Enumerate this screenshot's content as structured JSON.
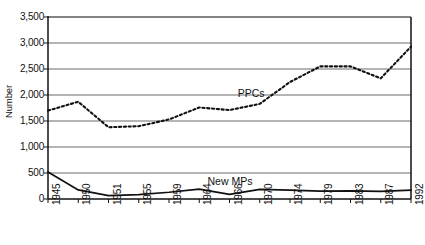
{
  "chart_data": {
    "type": "line",
    "title": "",
    "xlabel": "",
    "ylabel": "Number",
    "ylim": [
      0,
      3500
    ],
    "ytick_values": [
      0,
      500,
      1000,
      1500,
      2000,
      2500,
      3000,
      3500
    ],
    "ytick_labels": [
      "0",
      "500",
      "1,000",
      "1,500",
      "2,000",
      "2,500",
      "3,000",
      "3,500"
    ],
    "categories": [
      "1945",
      "1950",
      "1951",
      "1955",
      "1959",
      "1964",
      "1966",
      "1970",
      "1974",
      "1979",
      "1983",
      "1987",
      "1992"
    ],
    "grid": true,
    "legend_position": "inline-annotation",
    "series": [
      {
        "name": "PPCs",
        "style": "dashed",
        "color": "#111111",
        "values": [
          1700,
          1870,
          1380,
          1400,
          1530,
          1760,
          1710,
          1830,
          2250,
          2550,
          2550,
          2320,
          2930
        ]
      },
      {
        "name": "New MPs",
        "style": "solid",
        "color": "#111111",
        "values": [
          520,
          175,
          65,
          85,
          130,
          190,
          90,
          185,
          170,
          150,
          155,
          145,
          170
        ]
      }
    ],
    "annotations": [
      {
        "text": "PPCs",
        "x_year": "1970",
        "y_value": 2010
      },
      {
        "text": "New MPs",
        "x_year": "1966",
        "y_value": 330
      }
    ]
  },
  "axis": {
    "y_title": "Number"
  }
}
